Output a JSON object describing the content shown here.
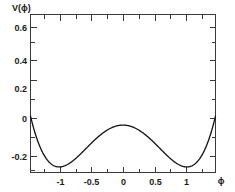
{
  "chart_data": {
    "type": "line",
    "title": "",
    "xlabel": "ϕ",
    "ylabel": "V(ϕ)",
    "xlim": [
      -1.45,
      1.45
    ],
    "ylim": [
      -0.3,
      0.7
    ],
    "grid": false,
    "legend": null,
    "x_ticks": [
      -1,
      -0.5,
      0,
      0.5,
      1
    ],
    "x_tick_labels": [
      "-1",
      "-0.5",
      "0",
      "0.5",
      "1"
    ],
    "y_ticks": [
      -0.2,
      0,
      0.2,
      0.4,
      0.6
    ],
    "y_tick_labels": [
      "-0.2",
      "0",
      "0.2",
      "0.4",
      "0.6"
    ],
    "x_minor_ticks": [
      -1.25,
      -0.75,
      -0.25,
      0.25,
      0.75,
      1.25
    ],
    "y_minor_ticks": [
      -0.1,
      0.1,
      0.3,
      0.5
    ],
    "curve_color": "#111111",
    "frame_color": "#3a3a3a",
    "background_color": "#ffffff",
    "series": [
      {
        "name": "V(ϕ)",
        "description": "symmetric double-well potential",
        "x": [
          -1.4,
          -1.35,
          -1.3,
          -1.25,
          -1.2,
          -1.15,
          -1.1,
          -1.05,
          -1.0,
          -0.95,
          -0.9,
          -0.85,
          -0.8,
          -0.75,
          -0.7,
          -0.65,
          -0.6,
          -0.55,
          -0.5,
          -0.45,
          -0.4,
          -0.35,
          -0.3,
          -0.25,
          -0.2,
          -0.15,
          -0.1,
          -0.05,
          0.0,
          0.05,
          0.1,
          0.15,
          0.2,
          0.25,
          0.3,
          0.35,
          0.4,
          0.45,
          0.5,
          0.55,
          0.6,
          0.65,
          0.7,
          0.75,
          0.8,
          0.85,
          0.9,
          0.95,
          1.0,
          1.05,
          1.1,
          1.15,
          1.2,
          1.25,
          1.3,
          1.35,
          1.4
        ],
        "y": [
          0.656,
          0.474,
          0.317,
          0.184,
          0.075,
          -0.013,
          -0.08,
          -0.129,
          -0.16,
          -0.176,
          -0.178,
          -0.169,
          -0.151,
          -0.125,
          -0.094,
          -0.06,
          -0.025,
          0.009,
          0.041,
          0.069,
          0.092,
          0.11,
          0.122,
          0.129,
          0.131,
          0.13,
          0.126,
          0.121,
          0.119,
          0.121,
          0.126,
          0.13,
          0.131,
          0.129,
          0.122,
          0.11,
          0.092,
          0.069,
          0.041,
          0.009,
          -0.025,
          -0.06,
          -0.094,
          -0.125,
          -0.151,
          -0.169,
          -0.178,
          -0.176,
          -0.16,
          -0.129,
          -0.08,
          -0.013,
          0.075,
          0.184,
          0.317,
          0.474,
          0.656
        ],
        "minima": [
          {
            "x": -1.0,
            "y": -0.265
          },
          {
            "x": 1.0,
            "y": -0.265
          }
        ],
        "local_maximum": {
          "x": 0.0,
          "y": 0.0
        }
      }
    ]
  },
  "axes": {
    "y_axis_title": "V(ϕ)",
    "x_axis_title": "ϕ"
  }
}
